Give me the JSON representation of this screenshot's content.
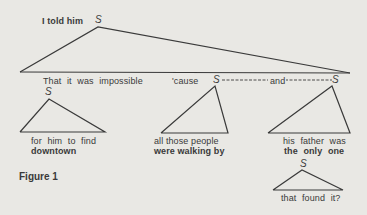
{
  "diagram": {
    "caption": "Figure 1",
    "root": {
      "prefix": "I told him",
      "node": "S"
    },
    "main_clause": {
      "text": "That it was impossible",
      "conjunction_1": "'cause",
      "node_a": "S",
      "conjunction_2": "and",
      "node_b": "S"
    },
    "left_subtree": {
      "node": "S",
      "line_1": "for him to find",
      "line_2": "downtown"
    },
    "middle_subtree": {
      "line_1": "all those people",
      "line_2": "were walking by"
    },
    "right_subtree": {
      "line_1": "his father was",
      "line_2": "the only one",
      "child": {
        "node": "S",
        "text": "that found it?"
      }
    },
    "colors": {
      "background": "#e9e8e4",
      "ink": "#3a3a3a"
    }
  }
}
